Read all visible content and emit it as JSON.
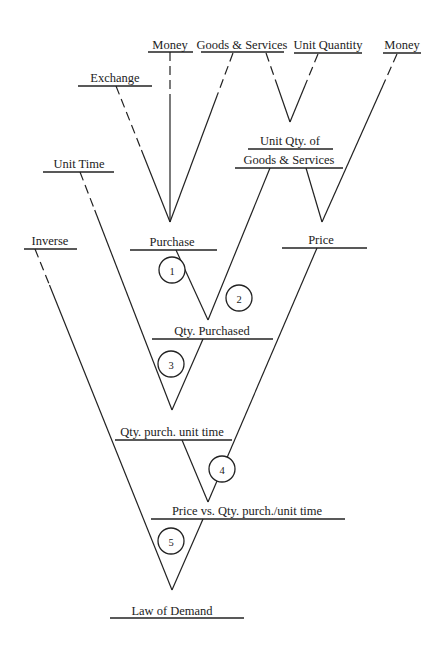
{
  "diagram": {
    "title": "Law of Demand",
    "colors": {
      "ink": "#222222",
      "background": "#ffffff"
    },
    "nodes": [
      {
        "id": "money_left",
        "label": "Money",
        "x": 170,
        "y": 38,
        "underline": [
          148,
          193,
          52
        ]
      },
      {
        "id": "goods_services_top",
        "label": "Goods & Services",
        "x": 242,
        "y": 38,
        "underline": [
          201,
          284,
          52
        ]
      },
      {
        "id": "unit_quantity",
        "label": "Unit Quantity",
        "x": 328,
        "y": 38,
        "underline": [
          294,
          362,
          53
        ]
      },
      {
        "id": "money_right",
        "label": "Money",
        "x": 402,
        "y": 38,
        "underline": [
          383,
          421,
          53
        ]
      },
      {
        "id": "exchange",
        "label": "Exchange",
        "x": 115,
        "y": 71,
        "underline": [
          78,
          152,
          86
        ]
      },
      {
        "id": "unit_time",
        "label": "Unit Time",
        "x": 79,
        "y": 157,
        "underline": [
          43,
          114,
          172
        ]
      },
      {
        "id": "unit_qty_of",
        "label": "Unit Qty. of",
        "x": 290,
        "y": 134,
        "underline": [
          248,
          333,
          149
        ]
      },
      {
        "id": "goods_services_mid",
        "label": "Goods & Services",
        "x": 289,
        "y": 153,
        "underline": [
          235,
          343,
          168
        ]
      },
      {
        "id": "inverse",
        "label": "Inverse",
        "x": 50,
        "y": 234,
        "underline": [
          24,
          77,
          249
        ]
      },
      {
        "id": "purchase",
        "label": "Purchase",
        "x": 172,
        "y": 235,
        "underline": [
          130,
          217,
          250
        ]
      },
      {
        "id": "price",
        "label": "Price",
        "x": 321,
        "y": 233,
        "underline": [
          282,
          367,
          248
        ]
      },
      {
        "id": "qty_purchased",
        "label": "Qty. Purchased",
        "x": 212,
        "y": 324,
        "underline": [
          152,
          273,
          339
        ]
      },
      {
        "id": "qty_purch_unit_time",
        "label": "Qty. purch. unit time",
        "x": 172,
        "y": 425,
        "underline": [
          115,
          232,
          440
        ]
      },
      {
        "id": "price_vs_qty",
        "label": "Price vs. Qty. purch./unit time",
        "x": 247,
        "y": 504,
        "underline": [
          151,
          345,
          519
        ]
      },
      {
        "id": "law_of_demand",
        "label": "Law of Demand",
        "x": 172,
        "y": 604,
        "underline": [
          110,
          244,
          618
        ]
      }
    ],
    "edges": [
      {
        "from": "money_left",
        "points": [
          170,
          52,
          170,
          222
        ],
        "dashed_until": 95
      },
      {
        "from": "exchange",
        "points": [
          116,
          86,
          170,
          222
        ],
        "dashed_until": 150
      },
      {
        "from": "goods_services_top",
        "points": [
          233,
          53,
          170,
          222
        ],
        "dashed_until": 95
      },
      {
        "from": "goods_services_top",
        "points": [
          266,
          53,
          290,
          122
        ],
        "dashed_until": 80
      },
      {
        "from": "unit_quantity",
        "points": [
          318,
          54,
          290,
          122
        ],
        "dashed_until": 85
      },
      {
        "from": "goods_services_mid",
        "points": [
          270,
          168,
          208,
          320
        ],
        "dashed_until": 0
      },
      {
        "from": "goods_services_mid",
        "points": [
          306,
          168,
          322,
          222
        ],
        "dashed_until": 0
      },
      {
        "from": "money_right",
        "points": [
          397,
          54,
          322,
          222
        ],
        "dashed_until": 85
      },
      {
        "from": "purchase",
        "points": [
          176,
          250,
          208,
          320
        ],
        "dashed_until": 0
      },
      {
        "from": "price",
        "points": [
          317,
          248,
          208,
          502
        ],
        "dashed_until": 0
      },
      {
        "from": "unit_time",
        "points": [
          80,
          172,
          172,
          410
        ],
        "dashed_until": 210
      },
      {
        "from": "qty_purchased",
        "points": [
          203,
          339,
          172,
          410
        ],
        "dashed_until": 0
      },
      {
        "from": "qty_purch_unit_time",
        "points": [
          182,
          440,
          208,
          502
        ],
        "dashed_until": 0
      },
      {
        "from": "inverse",
        "points": [
          35,
          249,
          172,
          590
        ],
        "dashed_until": 285
      },
      {
        "from": "price_vs_qty",
        "points": [
          203,
          519,
          172,
          590
        ],
        "dashed_until": 0
      }
    ],
    "steps": [
      {
        "label": "1",
        "cx": 172,
        "cy": 270
      },
      {
        "label": "2",
        "cx": 239,
        "cy": 298
      },
      {
        "label": "3",
        "cx": 171,
        "cy": 364
      },
      {
        "label": "4",
        "cx": 222,
        "cy": 469
      },
      {
        "label": "5",
        "cx": 171,
        "cy": 541
      }
    ]
  }
}
